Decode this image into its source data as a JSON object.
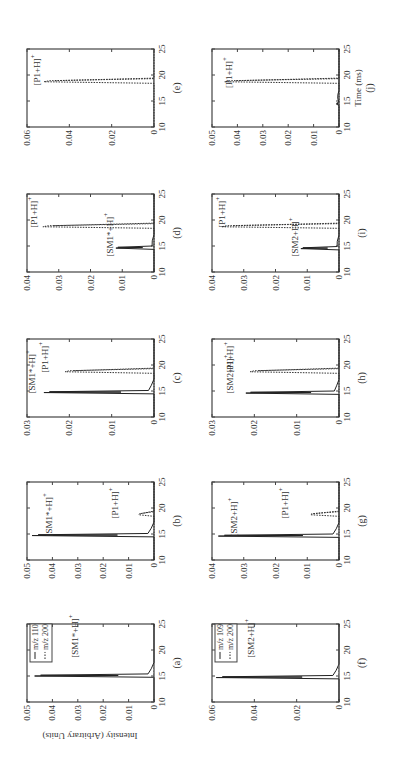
{
  "figure": {
    "ylabel": "Intensity (Arbitrary Units)",
    "xlabel": "Time (ms)",
    "rotation": "90deg counter-clockwise"
  },
  "chart_data": [
    {
      "panel": "(a)",
      "type": "line",
      "xlim": [
        10,
        25
      ],
      "ylim": [
        0,
        0.05
      ],
      "yticks": [
        "0",
        "0.01",
        "0.02",
        "0.03",
        "0.04",
        "0.05"
      ],
      "xticks": [
        "10",
        "15",
        "20",
        "25"
      ],
      "legend": [
        {
          "label": "m/z 110",
          "style": "solid"
        },
        {
          "label": "m/z 200",
          "style": "dotted"
        }
      ],
      "series": [
        {
          "name": "m/z 110",
          "style": "solid",
          "peak_x": 15.1,
          "peak_y": 0.047
        },
        {
          "name": "m/z 200",
          "style": "dotted",
          "peak_x": null,
          "peak_y": 0
        }
      ],
      "annotations": [
        {
          "text": "[SM1*+H]+",
          "x": 18.5,
          "y": 0.03
        }
      ]
    },
    {
      "panel": "(b)",
      "type": "line",
      "xlim": [
        10,
        25
      ],
      "ylim": [
        0,
        0.05
      ],
      "yticks": [
        "0",
        "0.01",
        "0.02",
        "0.03",
        "0.04",
        "0.05"
      ],
      "xticks": [
        "10",
        "15",
        "20",
        "25"
      ],
      "series": [
        {
          "name": "m/z 110",
          "style": "solid",
          "peak_x": 14.8,
          "peak_y": 0.048
        },
        {
          "name": "m/z 200",
          "style": "dotted",
          "peak_x": 18.8,
          "peak_y": 0.006
        }
      ],
      "annotations": [
        {
          "text": "[SM1*+H]+",
          "x": 14.5,
          "y": 0.04
        },
        {
          "text": "[P1+H]+",
          "x": 18.0,
          "y": 0.014
        }
      ]
    },
    {
      "panel": "(c)",
      "type": "line",
      "xlim": [
        10,
        25
      ],
      "ylim": [
        0,
        0.03
      ],
      "yticks": [
        "0",
        "0.01",
        "0.02",
        "0.03"
      ],
      "xticks": [
        "10",
        "15",
        "20",
        "25"
      ],
      "series": [
        {
          "name": "m/z 110",
          "style": "solid",
          "peak_x": 14.8,
          "peak_y": 0.026
        },
        {
          "name": "m/z 200",
          "style": "dotted",
          "peak_x": 18.8,
          "peak_y": 0.021
        }
      ],
      "annotations": [
        {
          "text": "[SM1*+H]+",
          "x": 14.5,
          "y": 0.028
        },
        {
          "text": "[P1+H]+",
          "x": 18.5,
          "y": 0.025
        }
      ]
    },
    {
      "panel": "(d)",
      "type": "line",
      "xlim": [
        10,
        25
      ],
      "ylim": [
        0,
        0.04
      ],
      "yticks": [
        "0",
        "0.01",
        "0.02",
        "0.03",
        "0.04"
      ],
      "xticks": [
        "10",
        "15",
        "20",
        "25"
      ],
      "series": [
        {
          "name": "m/z 110",
          "style": "solid",
          "peak_x": 14.7,
          "peak_y": 0.012
        },
        {
          "name": "m/z 200",
          "style": "dotted",
          "peak_x": 18.8,
          "peak_y": 0.035
        }
      ],
      "annotations": [
        {
          "text": "[SM1*+H]+",
          "x": 13.0,
          "y": 0.013
        },
        {
          "text": "[P1+H]+",
          "x": 18.5,
          "y": 0.037
        }
      ]
    },
    {
      "panel": "(e)",
      "type": "line",
      "xlim": [
        10,
        25
      ],
      "ylim": [
        0,
        0.06
      ],
      "yticks": [
        "0",
        "0.02",
        "0.04",
        "0.06"
      ],
      "xticks": [
        "10",
        "15",
        "20",
        "25"
      ],
      "series": [
        {
          "name": "m/z 110",
          "style": "solid",
          "peak_x": null,
          "peak_y": 0
        },
        {
          "name": "m/z 200",
          "style": "dotted",
          "peak_x": 18.8,
          "peak_y": 0.052
        }
      ],
      "annotations": [
        {
          "text": "[P1+H]+",
          "x": 18.0,
          "y": 0.054
        }
      ]
    },
    {
      "panel": "(f)",
      "type": "line",
      "xlim": [
        10,
        25
      ],
      "ylim": [
        0,
        0.06
      ],
      "yticks": [
        "0",
        "0.02",
        "0.04",
        "0.06"
      ],
      "xticks": [
        "10",
        "15",
        "20",
        "25"
      ],
      "legend": [
        {
          "label": "m/z 109",
          "style": "solid"
        },
        {
          "label": "m/z 200",
          "style": "dotted"
        }
      ],
      "series": [
        {
          "name": "m/z 109",
          "style": "solid",
          "peak_x": 14.8,
          "peak_y": 0.058
        },
        {
          "name": "m/z 200",
          "style": "dotted",
          "peak_x": null,
          "peak_y": 0
        }
      ],
      "annotations": [
        {
          "text": "[SM2+H]+",
          "x": 18.5,
          "y": 0.04
        }
      ]
    },
    {
      "panel": "(g)",
      "type": "line",
      "xlim": [
        10,
        25
      ],
      "ylim": [
        0,
        0.04
      ],
      "yticks": [
        "0",
        "0.01",
        "0.02",
        "0.03",
        "0.04"
      ],
      "xticks": [
        "10",
        "15",
        "20",
        "25"
      ],
      "series": [
        {
          "name": "m/z 109",
          "style": "solid",
          "peak_x": 14.7,
          "peak_y": 0.038
        },
        {
          "name": "m/z 200",
          "style": "dotted",
          "peak_x": 18.8,
          "peak_y": 0.009
        }
      ],
      "annotations": [
        {
          "text": "[SM2+H]+",
          "x": 14.5,
          "y": 0.032
        },
        {
          "text": "[P1+H]+",
          "x": 18.0,
          "y": 0.016
        }
      ]
    },
    {
      "panel": "(h)",
      "type": "line",
      "xlim": [
        10,
        25
      ],
      "ylim": [
        0,
        0.03
      ],
      "yticks": [
        "0",
        "0.01",
        "0.02",
        "0.03"
      ],
      "xticks": [
        "10",
        "15",
        "20",
        "25"
      ],
      "series": [
        {
          "name": "m/z 109",
          "style": "solid",
          "peak_x": 14.7,
          "peak_y": 0.022
        },
        {
          "name": "m/z 200",
          "style": "dotted",
          "peak_x": 18.8,
          "peak_y": 0.021
        }
      ],
      "annotations": [
        {
          "text": "[SM2+H]+",
          "x": 14.5,
          "y": 0.025
        },
        {
          "text": "[P1+H]+",
          "x": 18.5,
          "y": 0.025
        }
      ]
    },
    {
      "panel": "(i)",
      "type": "line",
      "xlim": [
        10,
        25
      ],
      "ylim": [
        0,
        0.04
      ],
      "yticks": [
        "0",
        "0.01",
        "0.02",
        "0.03",
        "0.04"
      ],
      "xticks": [
        "10",
        "15",
        "20",
        "25"
      ],
      "series": [
        {
          "name": "m/z 109",
          "style": "solid",
          "peak_x": 14.6,
          "peak_y": 0.012
        },
        {
          "name": "m/z 200",
          "style": "dotted",
          "peak_x": 18.8,
          "peak_y": 0.037
        }
      ],
      "annotations": [
        {
          "text": "[SM2+H]+",
          "x": 13.0,
          "y": 0.013
        },
        {
          "text": "[P1+H]+",
          "x": 18.5,
          "y": 0.036
        }
      ]
    },
    {
      "panel": "(j)",
      "type": "line",
      "xlim": [
        10,
        25
      ],
      "ylim": [
        0,
        0.05
      ],
      "yticks": [
        "0",
        "0.01",
        "0.02",
        "0.03",
        "0.04",
        "0.05"
      ],
      "xticks": [
        "10",
        "15",
        "20",
        "25"
      ],
      "xlabel": "Time (ms)",
      "series": [
        {
          "name": "m/z 109",
          "style": "solid",
          "peak_x": 14.5,
          "peak_y": 0.001
        },
        {
          "name": "m/z 200",
          "style": "dotted",
          "peak_x": 18.8,
          "peak_y": 0.045
        }
      ],
      "annotations": [
        {
          "text": "[P1+H]+",
          "x": 17.5,
          "y": 0.042
        }
      ]
    }
  ]
}
